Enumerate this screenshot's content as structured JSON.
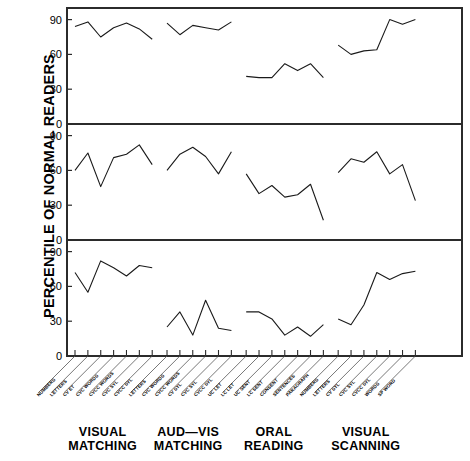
{
  "axis": {
    "ylabel": "PERCENTILE OF NORMAL READERS",
    "yticks": [
      "0",
      "30",
      "60",
      "90"
    ]
  },
  "groups": [
    {
      "id": "visual-matching",
      "title_line1": "VISUAL",
      "title_line2": "MATCHING",
      "labels": [
        "NUMBERS",
        "LETTERS",
        "CV ET",
        "CVC WORDS",
        "CVCC WORDS",
        "CVC SYL",
        "CVCC SYL"
      ]
    },
    {
      "id": "aud-vis-matching",
      "title_line1": "AUD—VIS",
      "title_line2": "MATCHING",
      "labels": [
        "LETTERS",
        "CVC WORDS",
        "CVCC WORDS",
        "CV SYL",
        "CVC SYL",
        "CVCC SYL"
      ]
    },
    {
      "id": "oral-reading",
      "title_line1": "ORAL",
      "title_line2": "READING",
      "labels": [
        "UC LET",
        "LC LET",
        "UC SENT",
        "LC SENT",
        "CONSENT",
        "SENTENCES",
        "PARAGRAPH"
      ]
    },
    {
      "id": "visual-scanning",
      "title_line1": "VISUAL",
      "title_line2": "SCANNING",
      "labels": [
        "NUMBERS",
        "LETTERS",
        "CV SYL",
        "CVC SYL",
        "CVCC SYL",
        "WORDS",
        "SP WORD"
      ]
    }
  ],
  "chart_data": {
    "type": "line",
    "title": "",
    "xlabel": "",
    "ylabel": "PERCENTILE OF NORMAL READERS",
    "ylim": [
      0,
      100
    ],
    "yticks": [
      0,
      30,
      60,
      90
    ],
    "grid": false,
    "legend": null,
    "panels": [
      {
        "panel": 1,
        "series": [
          {
            "name": "VISUAL MATCHING",
            "x": [
              "NUMBERS",
              "LETTERS",
              "CV ET",
              "CVC WORDS",
              "CVCC WORDS",
              "CVC SYL",
              "CVCC SYL"
            ],
            "values": [
              84,
              88,
              75,
              83,
              87,
              82,
              73
            ]
          },
          {
            "name": "AUD—VIS MATCHING",
            "x": [
              "LETTERS",
              "CVC WORDS",
              "CVCC WORDS",
              "CV SYL",
              "CVC SYL",
              "CVCC SYL"
            ],
            "values": [
              87,
              77,
              85,
              83,
              81,
              88
            ]
          },
          {
            "name": "ORAL READING",
            "x": [
              "UC LET",
              "LC LET",
              "UC SENT",
              "LC SENT",
              "CONSENT",
              "SENTENCES",
              "PARAGRAPH"
            ],
            "values": [
              41,
              40,
              40,
              52,
              46,
              52,
              40
            ]
          },
          {
            "name": "VISUAL SCANNING",
            "x": [
              "NUMBERS",
              "LETTERS",
              "CV SYL",
              "CVC SYL",
              "CVCC SYL",
              "WORDS",
              "SP WORD"
            ],
            "values": [
              68,
              60,
              63,
              64,
              90,
              86,
              90
            ]
          }
        ]
      },
      {
        "panel": 2,
        "series": [
          {
            "name": "VISUAL MATCHING",
            "x": [
              "NUMBERS",
              "LETTERS",
              "CV ET",
              "CVC WORDS",
              "CVCC WORDS",
              "CVC SYL",
              "CVCC SYL"
            ],
            "values": [
              60,
              75,
              46,
              71,
              74,
              82,
              65
            ]
          },
          {
            "name": "AUD—VIS MATCHING",
            "x": [
              "LETTERS",
              "CVC WORDS",
              "CVCC WORDS",
              "CV SYL",
              "CVC SYL",
              "CVCC SYL"
            ],
            "values": [
              60,
              74,
              80,
              72,
              57,
              76
            ]
          },
          {
            "name": "ORAL READING",
            "x": [
              "UC LET",
              "LC LET",
              "UC SENT",
              "LC SENT",
              "CONSENT",
              "SENTENCES",
              "PARAGRAPH"
            ],
            "values": [
              57,
              40,
              47,
              37,
              39,
              48,
              17
            ]
          },
          {
            "name": "VISUAL SCANNING",
            "x": [
              "NUMBERS",
              "LETTERS",
              "CV SYL",
              "CVC SYL",
              "CVCC SYL",
              "WORDS",
              "SP WORD"
            ],
            "values": [
              58,
              70,
              67,
              76,
              57,
              65,
              34,
              61
            ]
          }
        ]
      },
      {
        "panel": 3,
        "series": [
          {
            "name": "VISUAL MATCHING",
            "x": [
              "NUMBERS",
              "LETTERS",
              "CV ET",
              "CVC WORDS",
              "CVCC WORDS",
              "CVC SYL",
              "CVCC SYL"
            ],
            "values": [
              72,
              55,
              82,
              76,
              69,
              78,
              76
            ]
          },
          {
            "name": "AUD—VIS MATCHING",
            "x": [
              "LETTERS",
              "CVC WORDS",
              "CVCC WORDS",
              "CV SYL",
              "CVC SYL",
              "CVCC SYL"
            ],
            "values": [
              25,
              38,
              18,
              48,
              24,
              22,
              22
            ]
          },
          {
            "name": "ORAL READING",
            "x": [
              "UC LET",
              "LC LET",
              "UC SENT",
              "LC SENT",
              "CONSENT",
              "SENTENCES",
              "PARAGRAPH"
            ],
            "values": [
              38,
              38,
              32,
              18,
              25,
              17,
              27,
              24
            ]
          },
          {
            "name": "VISUAL SCANNING",
            "x": [
              "NUMBERS",
              "LETTERS",
              "CV SYL",
              "CVC SYL",
              "CVCC SYL",
              "WORDS",
              "SP WORD"
            ],
            "values": [
              32,
              27,
              44,
              72,
              66,
              71,
              73,
              57
            ]
          }
        ]
      }
    ]
  }
}
